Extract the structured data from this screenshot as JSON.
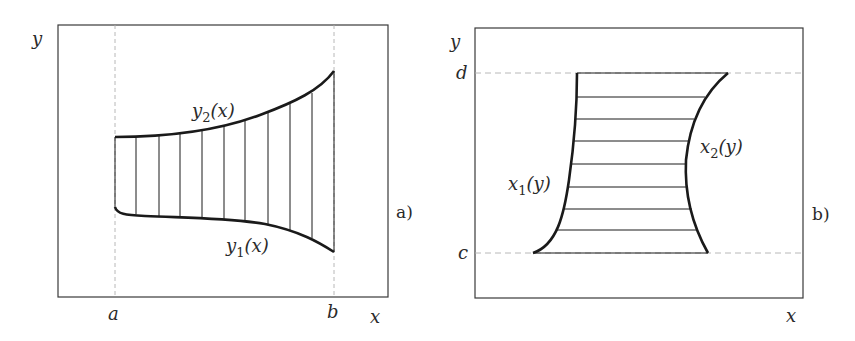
{
  "panel_a": {
    "tag": "a)",
    "y_axis_label": "y",
    "x_axis_label": "x",
    "left_bound_label": "a",
    "right_bound_label": "b",
    "upper_curve": {
      "name": "y",
      "sub": "2",
      "arg": "(x)"
    },
    "lower_curve": {
      "name": "y",
      "sub": "1",
      "arg": "(x)"
    }
  },
  "panel_b": {
    "tag": "b)",
    "y_axis_label": "y",
    "x_axis_label": "x",
    "top_bound_label": "d",
    "bottom_bound_label": "c",
    "left_curve": {
      "name": "x",
      "sub": "1",
      "arg": "(y)"
    },
    "right_curve": {
      "name": "x",
      "sub": "2",
      "arg": "(y)"
    }
  },
  "colors": {
    "stroke": "#1a1a1a",
    "frame": "#3a3a3a",
    "dashed": "#b0b0b0"
  }
}
